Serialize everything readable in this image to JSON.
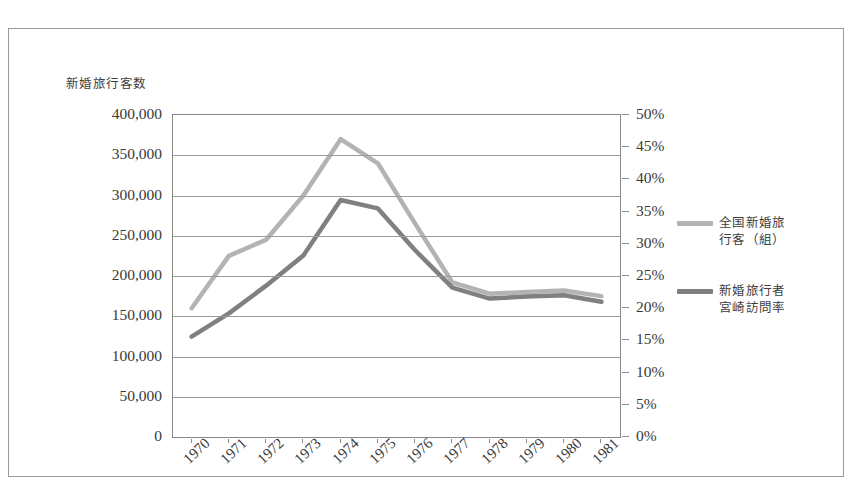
{
  "chart_data": {
    "type": "line",
    "title": "",
    "ylabel": "新婚旅行客数",
    "xlabel": "",
    "grid": true,
    "legend_position": "right",
    "categories": [
      "1970",
      "1971",
      "1972",
      "1973",
      "1974",
      "1975",
      "1976",
      "1977",
      "1978",
      "1979",
      "1980",
      "1981"
    ],
    "axes": {
      "left": {
        "label": "新婚旅行客数",
        "min": 0,
        "max": 400000,
        "step": 50000,
        "ticks": [
          "0",
          "50,000",
          "100,000",
          "150,000",
          "200,000",
          "250,000",
          "300,000",
          "350,000",
          "400,000"
        ]
      },
      "right": {
        "label": "",
        "min": 0,
        "max": 50,
        "step": 5,
        "unit": "%",
        "ticks": [
          "0%",
          "5%",
          "10%",
          "15%",
          "20%",
          "25%",
          "30%",
          "35%",
          "40%",
          "45%",
          "50%"
        ]
      }
    },
    "series": [
      {
        "name": "全国新婚旅行客（組）",
        "legend_line1": "全国新婚旅",
        "legend_line2": "行客（組）",
        "axis": "left",
        "color": "#b3b3b3",
        "values": [
          160000,
          225000,
          245000,
          300000,
          370000,
          340000,
          265000,
          192000,
          178000,
          180000,
          182000,
          175000
        ]
      },
      {
        "name": "新婚旅行者宮崎訪問率",
        "legend_line1": "新婚旅行者",
        "legend_line2": "宮崎訪問率",
        "axis": "right",
        "color": "#808080",
        "values": [
          15.6,
          19.2,
          23.5,
          28.2,
          36.8,
          35.5,
          29.0,
          23.2,
          21.5,
          21.8,
          22.0,
          21.0
        ]
      }
    ]
  },
  "figure": {
    "border_color": "#9a9a9a",
    "plot_border_color": "#888888",
    "gridline_color": "#9c9c9c",
    "background": "#ffffff"
  }
}
